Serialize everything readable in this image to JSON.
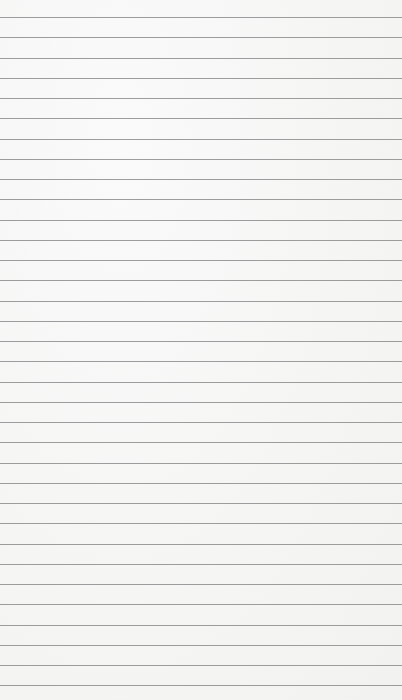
{
  "paper": {
    "background_color": "#f6f6f5",
    "line_color": "#8c8c8c",
    "first_line_y": 17,
    "line_spacing": 20.25,
    "line_count": 34
  }
}
